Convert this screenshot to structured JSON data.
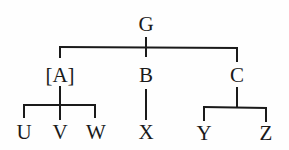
{
  "diagram": {
    "type": "tree",
    "colors": {
      "line": "#1a1a1a",
      "text": "#1a1a1a",
      "background": "#fefefe"
    },
    "nodes": {
      "G": {
        "label": "G",
        "x": 146,
        "y": 24
      },
      "A": {
        "label": "[A]",
        "x": 60,
        "y": 75
      },
      "B": {
        "label": "B",
        "x": 146,
        "y": 75
      },
      "C": {
        "label": "C",
        "x": 237,
        "y": 75
      },
      "U": {
        "label": "U",
        "x": 24,
        "y": 132
      },
      "V": {
        "label": "V",
        "x": 60,
        "y": 132
      },
      "W": {
        "label": "W",
        "x": 96,
        "y": 132
      },
      "X": {
        "label": "X",
        "x": 146,
        "y": 132
      },
      "Y": {
        "label": "Y",
        "x": 204,
        "y": 133
      },
      "Z": {
        "label": "Z",
        "x": 266,
        "y": 133
      }
    },
    "edges": [
      {
        "from": "G",
        "to": "A"
      },
      {
        "from": "G",
        "to": "B"
      },
      {
        "from": "G",
        "to": "C"
      },
      {
        "from": "A",
        "to": "U"
      },
      {
        "from": "A",
        "to": "V"
      },
      {
        "from": "A",
        "to": "W"
      },
      {
        "from": "B",
        "to": "X"
      },
      {
        "from": "C",
        "to": "Y"
      },
      {
        "from": "C",
        "to": "Z"
      }
    ]
  }
}
